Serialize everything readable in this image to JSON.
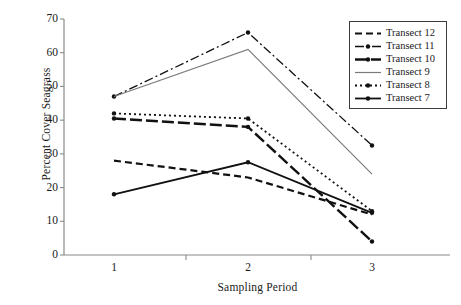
{
  "chart_data": {
    "type": "line",
    "title": "",
    "xlabel": "Sampling Period",
    "ylabel": "Percent Cover Seagrass",
    "categories": [
      "1",
      "2",
      "3"
    ],
    "x_tick_labels": [
      "1",
      "2",
      "3"
    ],
    "y_tick_labels": [
      "0",
      "10",
      "20",
      "30",
      "40",
      "50",
      "60",
      "70"
    ],
    "y_ticks": [
      0,
      10,
      20,
      30,
      40,
      50,
      60,
      70
    ],
    "ylim": [
      0,
      70
    ],
    "grid": false,
    "legend_position": "top-right",
    "series": [
      {
        "name": "Transect 12",
        "values": [
          28,
          23,
          12
        ],
        "style": "dashed",
        "color": "#111111",
        "width": 2.2,
        "dash": "7,4",
        "marker": "none"
      },
      {
        "name": "Transect 11",
        "values": [
          47,
          66,
          32.5
        ],
        "style": "dash-dot",
        "color": "#111111",
        "width": 1.3,
        "dash": "9,3,2,3",
        "marker": "dot"
      },
      {
        "name": "Transect 10",
        "values": [
          40.5,
          38,
          4
        ],
        "style": "long-dash",
        "color": "#111111",
        "width": 2.4,
        "dash": "12,4",
        "marker": "dot"
      },
      {
        "name": "Transect 9",
        "values": [
          47,
          61,
          24
        ],
        "style": "solid-thin",
        "color": "#7a7a7a",
        "width": 1.2,
        "dash": "none",
        "marker": "none"
      },
      {
        "name": "Transect 8",
        "values": [
          42,
          40.5,
          13
        ],
        "style": "dotted",
        "color": "#111111",
        "width": 1.8,
        "dash": "2,3",
        "marker": "dot"
      },
      {
        "name": "Transect 7",
        "values": [
          18,
          27.5,
          12.5
        ],
        "style": "solid",
        "color": "#111111",
        "width": 1.8,
        "dash": "none",
        "marker": "dot"
      }
    ]
  },
  "legend": {
    "items": [
      {
        "label": "Transect 12"
      },
      {
        "label": "Transect 11"
      },
      {
        "label": "Transect 10"
      },
      {
        "label": "Transect 9"
      },
      {
        "label": "Transect 8"
      },
      {
        "label": "Transect 7"
      }
    ]
  },
  "axes": {
    "x_title": "Sampling Period",
    "y_title": "Percent Cover Seagrass"
  }
}
